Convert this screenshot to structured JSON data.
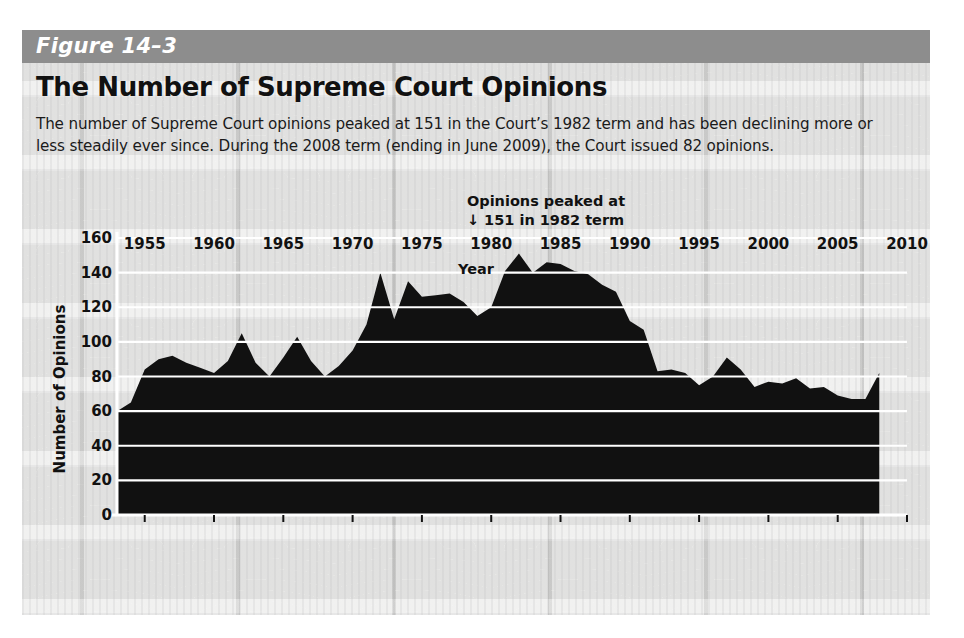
{
  "figure": {
    "band_label": "Figure 14–3",
    "title": "The Number of Supreme Court Opinions",
    "caption": "The number of Supreme Court opinions peaked at 151 in the Court’s 1982 term and has been declining more or less steadily ever since. During the 2008 term (ending in June 2009), the Court issued 82 opinions.",
    "band_color": "#8d8d8d",
    "background_color": "#dcdcda",
    "area_color": "#111111"
  },
  "chart_data": {
    "type": "area",
    "title": "The Number of Supreme Court Opinions",
    "xlabel": "Year",
    "ylabel": "Number of Opinions",
    "xlim": [
      1953,
      2010
    ],
    "ylim": [
      0,
      160
    ],
    "grid": true,
    "legend": "none",
    "ytick_labels": [
      "0",
      "20",
      "40",
      "60",
      "80",
      "100",
      "120",
      "140",
      "160"
    ],
    "yticks": [
      0,
      20,
      40,
      60,
      80,
      100,
      120,
      140,
      160
    ],
    "xtick_labels": [
      "1955",
      "1960",
      "1965",
      "1970",
      "1975",
      "1980",
      "1985",
      "1990",
      "1995",
      "2000",
      "2005",
      "2010"
    ],
    "xticks": [
      1955,
      1960,
      1965,
      1970,
      1975,
      1980,
      1985,
      1990,
      1995,
      2000,
      2005,
      2010
    ],
    "annotations": [
      {
        "text_line1": "Opinions peaked at",
        "text_line2": "151 in 1982 term",
        "arrow": "↓",
        "x": 1982,
        "y": 151
      }
    ],
    "x": [
      1953,
      1954,
      1955,
      1956,
      1957,
      1958,
      1959,
      1960,
      1961,
      1962,
      1963,
      1964,
      1965,
      1966,
      1967,
      1968,
      1969,
      1970,
      1971,
      1972,
      1973,
      1974,
      1975,
      1976,
      1977,
      1978,
      1979,
      1980,
      1981,
      1982,
      1983,
      1984,
      1985,
      1986,
      1987,
      1988,
      1989,
      1990,
      1991,
      1992,
      1993,
      1994,
      1995,
      1996,
      1997,
      1998,
      1999,
      2000,
      2001,
      2002,
      2003,
      2004,
      2005,
      2006,
      2007,
      2008
    ],
    "values": [
      60,
      65,
      84,
      90,
      92,
      88,
      85,
      82,
      89,
      105,
      88,
      80,
      91,
      103,
      89,
      80,
      86,
      95,
      110,
      140,
      113,
      135,
      126,
      127,
      128,
      123,
      115,
      120,
      141,
      151,
      140,
      146,
      145,
      141,
      139,
      133,
      129,
      112,
      107,
      83,
      84,
      82,
      75,
      80,
      91,
      84,
      74,
      77,
      76,
      79,
      73,
      74,
      69,
      67,
      67,
      82
    ],
    "series_name": "Number of Supreme Court Opinions"
  }
}
